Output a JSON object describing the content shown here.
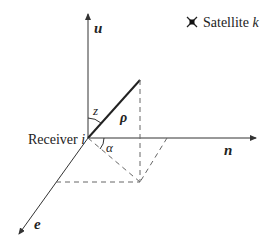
{
  "diagram": {
    "axes": {
      "u": {
        "label": "u"
      },
      "n": {
        "label": "n"
      },
      "e": {
        "label": "e"
      }
    },
    "origin_label": {
      "text": "Receiver ",
      "index": "i"
    },
    "vector_label": "ρ",
    "angles": {
      "zenith": "z",
      "azimuth": "α"
    },
    "legend": {
      "icon": "satellite-icon",
      "text": "Satellite ",
      "index": "k"
    },
    "colors": {
      "line": "#333333",
      "dashed": "#666666",
      "text": "#222222"
    }
  }
}
